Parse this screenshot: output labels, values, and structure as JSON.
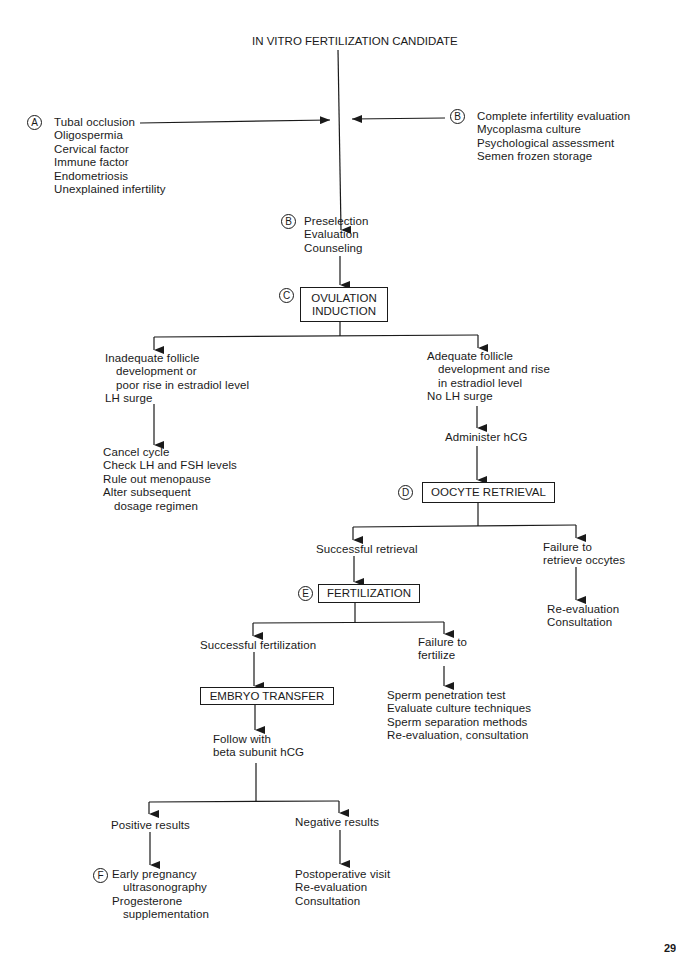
{
  "title": "IN VITRO FERTILIZATION CANDIDATE",
  "indications": {
    "marker": "A",
    "items": [
      "Tubal occlusion",
      "Oligospermia",
      "Cervical factor",
      "Immune factor",
      "Endometriosis",
      "Unexplained infertility"
    ]
  },
  "workup": {
    "marker": "B",
    "items": [
      "Complete infertility evaluation",
      "Mycoplasma culture",
      "Psychological assessment",
      "Semen frozen storage"
    ]
  },
  "preselection": {
    "marker": "B",
    "items": [
      "Preselection",
      "Evaluation",
      "Counseling"
    ]
  },
  "ovulation_induction": {
    "marker": "C",
    "lines": [
      "OVULATION",
      "INDUCTION"
    ]
  },
  "inadequate": {
    "lines": [
      "Inadequate follicle",
      "development or",
      "poor rise in estradiol level",
      "LH surge"
    ]
  },
  "cancel": {
    "lines": [
      "Cancel cycle",
      "Check LH and FSH levels",
      "Rule out menopause",
      "Alter subsequent",
      "dosage regimen"
    ]
  },
  "adequate": {
    "lines": [
      "Adequate follicle",
      "development and rise",
      "in estradiol level",
      "No LH surge"
    ]
  },
  "administer": "Administer hCG",
  "oocyte_retrieval": {
    "marker": "D",
    "label": "OOCYTE RETRIEVAL"
  },
  "successful_retrieval": "Successful retrieval",
  "failure_retrieve": {
    "lines": [
      "Failure to",
      "retrieve occytes"
    ]
  },
  "retrieve_followup": {
    "lines": [
      "Re-evaluation",
      "Consultation"
    ]
  },
  "fertilization": {
    "marker": "E",
    "label": "FERTILIZATION"
  },
  "successful_fertilization": "Successful fertilization",
  "failure_fertilize": {
    "lines": [
      "Failure to",
      "fertilize"
    ]
  },
  "fertilize_followup": {
    "lines": [
      "Sperm penetration test",
      "Evaluate culture techniques",
      "Sperm separation methods",
      "Re-evaluation, consultation"
    ]
  },
  "embryo_transfer": {
    "label": "EMBRYO TRANSFER"
  },
  "follow_with": {
    "lines": [
      "Follow with",
      "beta subunit hCG"
    ]
  },
  "positive": "Positive results",
  "negative": "Negative results",
  "positive_followup": {
    "marker": "F",
    "lines": [
      "Early pregnancy",
      "ultrasonography",
      "Progesterone",
      "supplementation"
    ]
  },
  "negative_followup": {
    "lines": [
      "Postoperative visit",
      "Re-evaluation",
      "Consultation"
    ]
  },
  "page_number": "29"
}
